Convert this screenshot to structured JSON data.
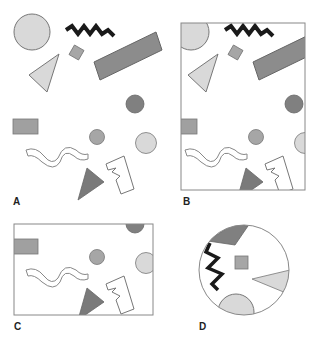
{
  "colors": {
    "light_gray": "#d9d9d9",
    "mid_gray": "#a6a6a6",
    "dark_gray": "#808080",
    "stroke": "#777777",
    "zigzag": "#1a1a1a",
    "frame": "#888888"
  },
  "panels": [
    {
      "id": "A",
      "label": "A",
      "frame": "none"
    },
    {
      "id": "B",
      "label": "B",
      "frame": "rectangle"
    },
    {
      "id": "C",
      "label": "C",
      "frame": "rectangle"
    },
    {
      "id": "D",
      "label": "D",
      "frame": "circle"
    }
  ],
  "shapes": [
    "large-light-circle",
    "black-zigzag-line",
    "small-diamond",
    "large-rotated-rectangle",
    "light-triangle",
    "dark-circle",
    "small-rectangle",
    "small-circle",
    "light-circle-right",
    "wavy-outline-shape",
    "dark-triangle",
    "jagged-outline-shape"
  ]
}
